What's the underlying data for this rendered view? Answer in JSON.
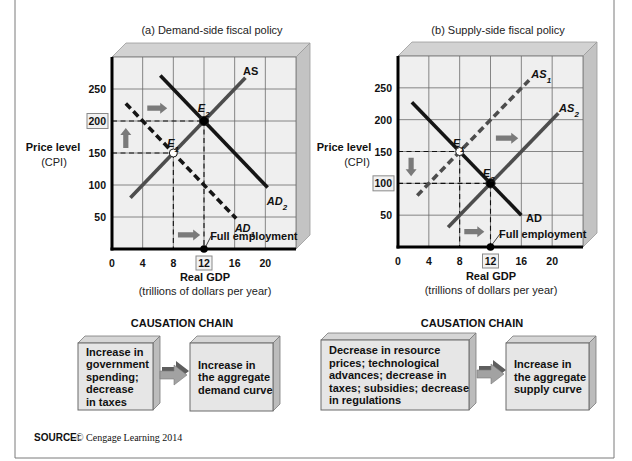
{
  "chart_data": [
    {
      "type": "line",
      "title": "(a) Demand-side fiscal policy",
      "xlabel": "Real GDP",
      "xlabel_sub": "(trillions of dollars per year)",
      "ylabel": "Price level",
      "ylabel_sub": "(CPI)",
      "xlim": [
        0,
        24
      ],
      "ylim": [
        0,
        300
      ],
      "xticks": [
        0,
        4,
        8,
        12,
        16,
        20
      ],
      "yticks": [
        50,
        100,
        150,
        200,
        250
      ],
      "highlight_xticks": [
        12
      ],
      "highlight_yticks": [
        200
      ],
      "grid": true,
      "series": [
        {
          "name": "AS",
          "sub": "",
          "italic": false,
          "style": "solid",
          "color": "#4d4d4d",
          "points": [
            [
              2.4,
              80
            ],
            [
              17.4,
              267.5
            ]
          ],
          "label_pos": [
            17.1,
            272
          ]
        },
        {
          "name": "AD",
          "sub": "1",
          "italic": true,
          "style": "dashed",
          "color": "#151515",
          "points": [
            [
              1.8,
              227.5
            ],
            [
              16.2,
              47.5
            ]
          ],
          "label_pos": [
            16.0,
            27
          ]
        },
        {
          "name": "AD",
          "sub": "2",
          "italic": true,
          "style": "solid",
          "color": "#151515",
          "points": [
            [
              6.3,
              271
            ],
            [
              20.3,
              96
            ]
          ],
          "label_pos": [
            20.2,
            69
          ]
        }
      ],
      "equilibria": [
        {
          "name": "E",
          "sub": "1",
          "x": 8,
          "y": 150,
          "fill": "open",
          "label_pos": [
            7.2,
            159
          ]
        },
        {
          "name": "E",
          "sub": "2",
          "x": 12,
          "y": 200,
          "fill": "filled",
          "label_pos": [
            11.2,
            214
          ]
        }
      ],
      "shift_arrows": [
        {
          "direction": "right",
          "from": [
            4.6,
            220
          ],
          "to": [
            7.2,
            220
          ]
        },
        {
          "direction": "up",
          "from": [
            1.8,
            158
          ],
          "to": [
            1.8,
            189
          ]
        },
        {
          "direction": "right",
          "from": [
            8.6,
            22
          ],
          "to": [
            11.5,
            22
          ]
        }
      ],
      "annotation": {
        "text": "Full employment",
        "x": 12,
        "y": 0,
        "label_pos": [
          12.8,
          14
        ]
      }
    },
    {
      "type": "line",
      "title": "(b) Supply-side fiscal policy",
      "xlabel": "Real GDP",
      "xlabel_sub": "(trillions of dollars per year)",
      "ylabel": "Price level",
      "ylabel_sub": "(CPI)",
      "xlim": [
        0,
        24
      ],
      "ylim": [
        0,
        300
      ],
      "xticks": [
        0,
        4,
        8,
        12,
        16,
        20
      ],
      "yticks": [
        50,
        100,
        150,
        200,
        250
      ],
      "highlight_xticks": [
        12
      ],
      "highlight_yticks": [
        100
      ],
      "grid": true,
      "series": [
        {
          "name": "AS",
          "sub": "1",
          "italic": true,
          "style": "dashed",
          "color": "#4d4d4d",
          "points": [
            [
              2.5,
              81
            ],
            [
              17.0,
              262
            ]
          ],
          "label_pos": [
            17.3,
            265
          ]
        },
        {
          "name": "AS",
          "sub": "2",
          "italic": true,
          "style": "solid",
          "color": "#4d4d4d",
          "points": [
            [
              6.5,
              31
            ],
            [
              20.8,
              210
            ]
          ],
          "label_pos": [
            20.9,
            212
          ]
        },
        {
          "name": "AD",
          "sub": "",
          "italic": false,
          "style": "solid",
          "color": "#151515",
          "points": [
            [
              1.8,
              227.5
            ],
            [
              16.0,
              50
            ]
          ],
          "label_pos": [
            16.6,
            39
          ]
        }
      ],
      "equilibria": [
        {
          "name": "E",
          "sub": "1",
          "x": 8,
          "y": 150,
          "fill": "open",
          "label_pos": [
            7.1,
            157
          ]
        },
        {
          "name": "E",
          "sub": "2",
          "x": 12,
          "y": 100,
          "fill": "filled",
          "label_pos": [
            11.0,
            110
          ]
        }
      ],
      "shift_arrows": [
        {
          "direction": "right",
          "from": [
            12.7,
            171
          ],
          "to": [
            15.6,
            171
          ]
        },
        {
          "direction": "down",
          "from": [
            1.7,
            140
          ],
          "to": [
            1.7,
            111
          ]
        },
        {
          "direction": "right",
          "from": [
            8.6,
            24
          ],
          "to": [
            11.2,
            24
          ]
        }
      ],
      "annotation": {
        "text": "Full employment",
        "x": 12,
        "y": 0,
        "label_pos": [
          13.1,
          14
        ]
      }
    }
  ],
  "causation": [
    {
      "heading": "CAUSATION CHAIN",
      "cause": [
        "Increase in",
        "government",
        "spending;",
        "decrease",
        "in taxes"
      ],
      "effect": [
        "Increase in",
        "the aggregate",
        "demand curve"
      ]
    },
    {
      "heading": "CAUSATION CHAIN",
      "cause": [
        "Decrease in resource",
        "prices; technological",
        "advances; decrease in",
        "taxes; subsidies; decrease",
        "in regulations"
      ],
      "effect": [
        "Increase in",
        "the aggregate",
        "supply curve"
      ]
    }
  ],
  "source": {
    "label": "SOURCE:",
    "text": "© Cengage Learning 2014"
  },
  "colors": {
    "front_face": "#efefef",
    "top_face": "#d2d2d2",
    "side_face": "#c3c3c3",
    "grid": "#6a6a6a",
    "shift_arrow": "#7a7a7a",
    "box_front": "#e6e6e6",
    "box_top": "#d6d6d6",
    "box_side": "#bcbcbc"
  }
}
